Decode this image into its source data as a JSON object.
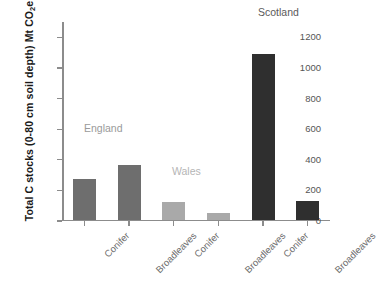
{
  "chart_data": {
    "type": "bar",
    "title": "",
    "xlabel": "",
    "ylabel": "Total C stocks (0-80 cm soil depth) Mt CO2e",
    "ylabel_parts": {
      "before": "Total C stocks (0-80 cm soil depth) Mt CO",
      "subscript": "2",
      "after": "e"
    },
    "ylim": [
      0,
      1300
    ],
    "yticks": [
      0,
      200,
      400,
      600,
      800,
      1000,
      1200
    ],
    "ytick_labels": [
      "0",
      "200",
      "400",
      "600",
      "800",
      "1000",
      "1200"
    ],
    "grid": false,
    "legend": "none",
    "categories": [
      "Conifer",
      "Broadleaves",
      "Conifer",
      "Broadleaves",
      "Conifer",
      "Broadleaves"
    ],
    "values": [
      263,
      353,
      112,
      45,
      1082,
      120
    ],
    "bar_colors": [
      "#6e6e6e",
      "#6e6e6e",
      "#a9a9a9",
      "#a9a9a9",
      "#2f2f2f",
      "#2f2f2f"
    ],
    "groups": [
      {
        "name": "England",
        "color": "#9a9a9a",
        "categories": [
          "Conifer",
          "Broadleaves"
        ],
        "values": [
          263,
          353
        ]
      },
      {
        "name": "Wales",
        "color": "#b5b5b5",
        "categories": [
          "Conifer",
          "Broadleaves"
        ],
        "values": [
          112,
          45
        ]
      },
      {
        "name": "Scotland",
        "color": "#5a5a5a",
        "categories": [
          "Conifer",
          "Broadleaves"
        ],
        "values": [
          1082,
          120
        ]
      }
    ],
    "annotations": [
      {
        "text": "England",
        "color": "#9a9a9a"
      },
      {
        "text": "Wales",
        "color": "#b5b5b5"
      },
      {
        "text": "Scotland",
        "color": "#5a5a5a"
      }
    ]
  }
}
